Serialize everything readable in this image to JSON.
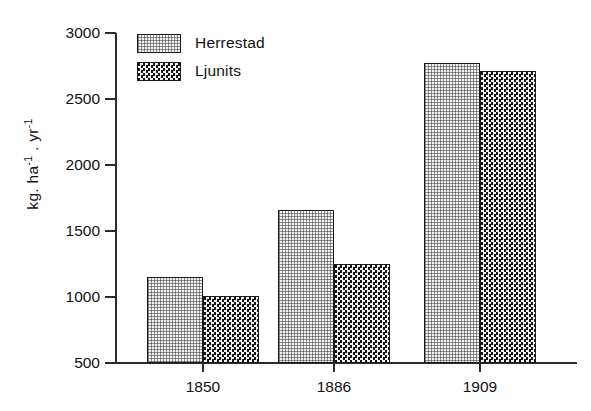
{
  "chart_data": {
    "type": "bar",
    "title": "",
    "xlabel": "",
    "ylabel": "kg. ha-1 . yr-1",
    "ylabel_parts": {
      "prefix": "kg. ha",
      "exp1": "-1",
      "middle": " . yr",
      "exp2": "-1"
    },
    "categories": [
      "1850",
      "1886",
      "1909"
    ],
    "series": [
      {
        "name": "Herrestad",
        "values": [
          1150,
          1660,
          2770
        ],
        "pattern": "light-dotted"
      },
      {
        "name": "Ljunits",
        "values": [
          1010,
          1250,
          2715
        ],
        "pattern": "dark-checkered"
      }
    ],
    "ylim": [
      500,
      3000
    ],
    "yticks": [
      3000,
      2500,
      2000,
      1500,
      1000,
      500
    ],
    "ytick_labels": [
      "3000",
      "2500",
      "2000",
      "1500",
      "1000",
      "500"
    ],
    "grid": false,
    "legend_position": "top-left-inside"
  },
  "legend": {
    "entries": [
      {
        "label": "Herrestad"
      },
      {
        "label": "Ljunits"
      }
    ]
  },
  "colors": {
    "axis": "#2b2b2b",
    "bar_outline": "#1a1a1a",
    "series_light_fill": "#f2f2f2",
    "series_dark_fill": "#1b1b1b",
    "text": "#111111",
    "background": "#ffffff"
  }
}
